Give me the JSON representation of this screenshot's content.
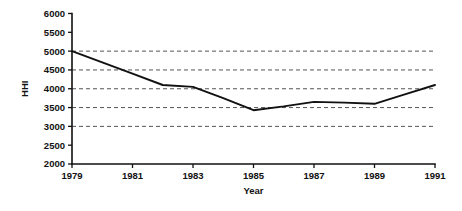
{
  "chart_data": {
    "type": "line",
    "title": "",
    "subtitle": "",
    "xlabel": "Year",
    "ylabel": "HHI",
    "xlim": [
      1979,
      1991
    ],
    "ylim": [
      2000,
      6000
    ],
    "grid": true,
    "grid_axis": "y",
    "grid_values": [
      3000,
      3500,
      4000,
      4500,
      5000
    ],
    "legend": false,
    "legend_position": "none",
    "x_tick_labels": [
      "1979",
      "1981",
      "1983",
      "1985",
      "1987",
      "1989",
      "1991"
    ],
    "x_tick_values": [
      1979,
      1981,
      1983,
      1985,
      1987,
      1989,
      1991
    ],
    "y_tick_labels": [
      "2000",
      "2500",
      "3000",
      "3500",
      "4000",
      "4500",
      "5000",
      "5500",
      "6000"
    ],
    "y_tick_values": [
      2000,
      2500,
      3000,
      3500,
      4000,
      4500,
      5000,
      5500,
      6000
    ],
    "x": [
      1979,
      1980,
      1981,
      1982,
      1983,
      1984,
      1985,
      1986,
      1987,
      1988,
      1989,
      1990,
      1991
    ],
    "series": [
      {
        "name": "HHI",
        "color": "#111111",
        "values": [
          5000,
          4700,
          4400,
          4100,
          4050,
          3750,
          3430,
          3530,
          3650,
          3630,
          3600,
          3850,
          4100
        ]
      }
    ]
  },
  "axis": {
    "y_title": "HHI",
    "x_title": "Year"
  },
  "colors": {
    "line": "#111111",
    "grid": "#555555",
    "axis": "#111111",
    "background": "#ffffff"
  }
}
